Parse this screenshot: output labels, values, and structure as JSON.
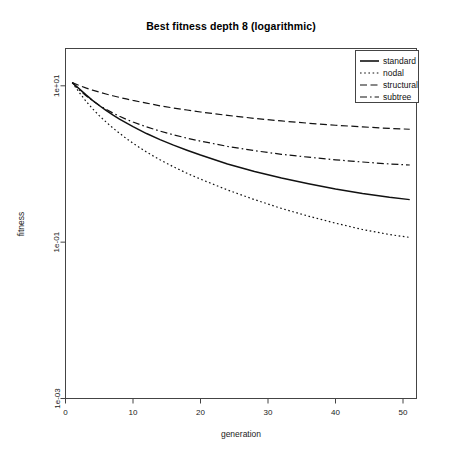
{
  "chart_data": {
    "type": "line",
    "title": "Best fitness depth 8 (logarithmic)",
    "xlabel": "generation",
    "ylabel": "fitness",
    "xlim": [
      0,
      52
    ],
    "ylim": [
      0.001,
      30
    ],
    "yscale": "log",
    "grid": false,
    "legend_position": "top-right",
    "xticks": [
      0,
      10,
      20,
      30,
      40,
      50
    ],
    "xtick_labels": [
      "0",
      "10",
      "20",
      "30",
      "40",
      "50"
    ],
    "yticks": [
      10,
      0.1,
      0.001
    ],
    "ytick_labels": [
      "1e+01",
      "1e-01",
      "1e-03"
    ],
    "x": [
      1,
      2,
      3,
      4,
      5,
      6,
      7,
      8,
      9,
      10,
      12,
      14,
      16,
      18,
      20,
      24,
      28,
      32,
      36,
      40,
      44,
      48,
      51
    ],
    "series": [
      {
        "name": "standard",
        "style": "solid",
        "values": [
          11.0,
          9.2,
          7.7,
          6.5,
          5.6,
          4.85,
          4.25,
          3.75,
          3.35,
          3.0,
          2.45,
          2.05,
          1.74,
          1.5,
          1.3,
          1.0,
          0.8,
          0.66,
          0.56,
          0.48,
          0.42,
          0.375,
          0.35
        ]
      },
      {
        "name": "nodal",
        "style": "dotted",
        "values": [
          11.0,
          8.3,
          6.4,
          5.1,
          4.15,
          3.45,
          2.9,
          2.47,
          2.12,
          1.84,
          1.42,
          1.13,
          0.92,
          0.76,
          0.64,
          0.465,
          0.35,
          0.27,
          0.215,
          0.175,
          0.145,
          0.125,
          0.115
        ]
      },
      {
        "name": "structural",
        "style": "dashed",
        "values": [
          11.0,
          10.1,
          9.4,
          8.8,
          8.3,
          7.85,
          7.45,
          7.1,
          6.8,
          6.5,
          6.0,
          5.55,
          5.2,
          4.9,
          4.62,
          4.18,
          3.83,
          3.55,
          3.32,
          3.13,
          2.98,
          2.85,
          2.78
        ]
      },
      {
        "name": "subtree",
        "style": "dashdot",
        "values": [
          11.0,
          8.9,
          7.5,
          6.45,
          5.65,
          5.0,
          4.5,
          4.08,
          3.73,
          3.44,
          2.98,
          2.63,
          2.36,
          2.14,
          1.96,
          1.68,
          1.48,
          1.33,
          1.22,
          1.13,
          1.06,
          1.0,
          0.97
        ]
      }
    ]
  },
  "legend": {
    "entries": [
      {
        "label": "standard",
        "style": "solid"
      },
      {
        "label": "nodal",
        "style": "dotted"
      },
      {
        "label": "structural",
        "style": "dashed"
      },
      {
        "label": "subtree",
        "style": "dashdot"
      }
    ]
  }
}
